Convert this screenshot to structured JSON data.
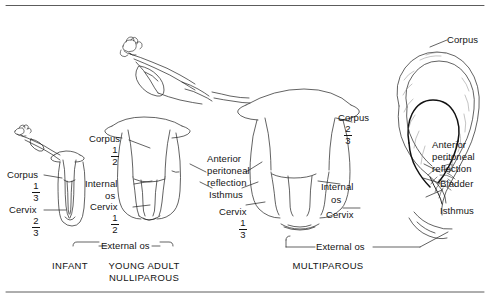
{
  "figure": {
    "background_color": "#ffffff",
    "line_color": "#1a1a1a",
    "text_color": "#141414"
  },
  "rules": {
    "top_label": "top-divider-rule",
    "bottom_label": "bottom-divider-rule"
  },
  "panels": [
    {
      "id": "infant",
      "caption": "INFANT",
      "labels": [
        {
          "name": "corpus",
          "text": "Corpus",
          "fraction": {
            "numerator": "1",
            "denominator": "3"
          }
        },
        {
          "name": "cervix",
          "text": "Cervix",
          "fraction": {
            "numerator": "2",
            "denominator": "3"
          }
        }
      ]
    },
    {
      "id": "young-adult-nulliparous",
      "caption": "YOUNG ADULT\nNULLIPAROUS",
      "labels": [
        {
          "name": "corpus",
          "text": "Corpus",
          "fraction": {
            "numerator": "1",
            "denominator": "2"
          }
        },
        {
          "name": "internal-os",
          "text": "Internal\nos"
        },
        {
          "name": "cervix",
          "text": "Cervix",
          "fraction": {
            "numerator": "1",
            "denominator": "2"
          }
        },
        {
          "name": "external-os",
          "text": "External os"
        },
        {
          "name": "anterior-peritoneal-reflection",
          "text": "Anterior\nperitoneal\nreflection"
        },
        {
          "name": "isthmus",
          "text": "Isthmus"
        },
        {
          "name": "cervix-middle",
          "text": "Cervix",
          "fraction": {
            "numerator": "1",
            "denominator": "3"
          }
        }
      ]
    },
    {
      "id": "multiparous",
      "caption": "MULTIPAROUS",
      "labels": [
        {
          "name": "corpus",
          "text": "Corpus",
          "fraction": {
            "numerator": "2",
            "denominator": "3"
          }
        },
        {
          "name": "internal-os",
          "text": "Internal\nos"
        },
        {
          "name": "cervix",
          "text": "Cervix"
        },
        {
          "name": "external-os",
          "text": "External os"
        }
      ]
    },
    {
      "id": "sagittal-section",
      "caption": "",
      "labels": [
        {
          "name": "corpus",
          "text": "Corpus"
        },
        {
          "name": "anterior-peritoneal-reflection",
          "text": "Anterior\nperitoneal\nreflection"
        },
        {
          "name": "bladder",
          "text": "Bladder"
        },
        {
          "name": "isthmus",
          "text": "Isthmus"
        }
      ]
    }
  ],
  "label_text": {
    "infant_corpus": "Corpus",
    "infant_corpus_num": "1",
    "infant_corpus_den": "3",
    "infant_cervix": "Cervix",
    "infant_cervix_num": "2",
    "infant_cervix_den": "3",
    "infant_caption": "INFANT",
    "ya_corpus": "Corpus",
    "ya_corpus_num": "1",
    "ya_corpus_den": "2",
    "ya_internal": "Internal",
    "ya_internal_os": "os",
    "ya_cervix": "Cervix",
    "ya_cervix_num": "1",
    "ya_cervix_den": "2",
    "ya_external_os": "External os",
    "ya_caption": "YOUNG ADULT\nNULLIPAROUS",
    "mid_apr_l1": "Anterior",
    "mid_apr_l2": "peritoneal",
    "mid_apr_l3": "reflection",
    "mid_isthmus": "Isthmus",
    "mid_cervix": "Cervix",
    "mid_cervix_num": "1",
    "mid_cervix_den": "3",
    "mp_corpus": "Corpus",
    "mp_corpus_num": "2",
    "mp_corpus_den": "3",
    "mp_internal": "Internal",
    "mp_internal_os": "os",
    "mp_cervix": "Cervix",
    "mp_external_os": "External os",
    "mp_caption": "MULTIPAROUS",
    "sag_corpus": "Corpus",
    "sag_apr_l1": "Anterior",
    "sag_apr_l2": "peritoneal",
    "sag_apr_l3": "reflection",
    "sag_bladder": "Bladder",
    "sag_isthmus": "Isthmus"
  }
}
